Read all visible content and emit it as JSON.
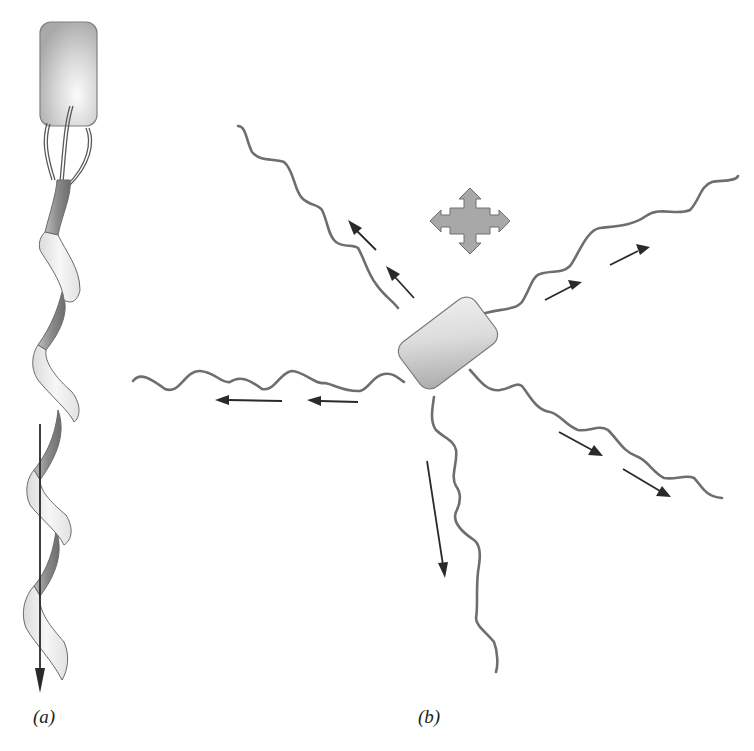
{
  "figure": {
    "panels": [
      {
        "id": "a",
        "label": "(a)",
        "description": "Bacterium with bundled flagella forming a single helical filament; thrust arrow points downward along the helix axis"
      },
      {
        "id": "b",
        "label": "(b)",
        "description": "Bacterium with flagella splayed out in all directions (tumbling); arrows point outward along each flagellum; four-way arrow indicates random reorientation"
      }
    ],
    "colors": {
      "cell_fill": "#c9c9c9",
      "cell_outline": "#777777",
      "flagellum": "#6e6e6e",
      "helix_light": "#efefef",
      "helix_dark": "#8f8f8f",
      "arrow": "#2a2a2a",
      "tumble_icon": "#a8a8a8"
    },
    "icons": {
      "tumble": "four-way-arrow-icon"
    }
  }
}
